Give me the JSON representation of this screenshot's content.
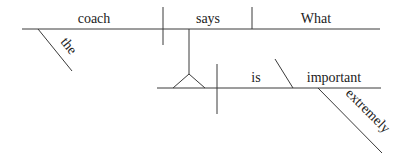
{
  "diagram": {
    "type": "sentence-diagram",
    "words": {
      "subject": "coach",
      "subject_modifier": "the",
      "verb": "says",
      "object": "What",
      "clause_verb": "is",
      "clause_complement": "important",
      "complement_modifier": "extremely"
    },
    "colors": {
      "line": "#3a3a3a",
      "text": "#222222",
      "background": "#ffffff"
    }
  }
}
